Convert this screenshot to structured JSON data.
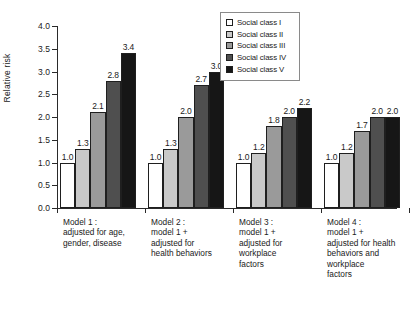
{
  "chart_data": {
    "type": "bar",
    "title": "",
    "xlabel": "",
    "ylabel": "Relative risk",
    "ylim": [
      0.0,
      4.0
    ],
    "ytick_labels": [
      "0.0",
      "0.5",
      "1.0",
      "1.5",
      "2.0",
      "2.5",
      "3.0",
      "3.5",
      "4.0"
    ],
    "ytick_values": [
      0.0,
      0.5,
      1.0,
      1.5,
      2.0,
      2.5,
      3.0,
      3.5,
      4.0
    ],
    "grid": false,
    "legend_position": "top-center-right",
    "categories": [
      "Model 1 :\nadjusted for age,\ngender, disease",
      "Model 2 :\nmodel 1 +\nadjusted for\nhealth behaviors",
      "Model 3 :\nmodel 1 +\nadjusted for\nworkplace\nfactors",
      "Model 4 :\nmodel 1 +\nadjusted for health\nbehaviors and\nworkplace\nfactors"
    ],
    "series": [
      {
        "name": "Social class I",
        "color": "#ffffff",
        "values": [
          1.0,
          1.0,
          1.0,
          1.0
        ]
      },
      {
        "name": "Social class II",
        "color": "#c9c9c9",
        "values": [
          1.3,
          1.3,
          1.2,
          1.2
        ]
      },
      {
        "name": "Social class III",
        "color": "#9a9a9a",
        "values": [
          2.1,
          2.0,
          1.8,
          1.7
        ]
      },
      {
        "name": "Social class IV",
        "color": "#4f4f4f",
        "values": [
          2.8,
          2.7,
          2.0,
          2.0
        ]
      },
      {
        "name": "Social class V",
        "color": "#161616",
        "values": [
          3.4,
          3.0,
          2.2,
          2.0
        ]
      }
    ],
    "data_labels": [
      [
        "1.0",
        "1.3",
        "2.1",
        "2.8",
        "3.4"
      ],
      [
        "1.0",
        "1.3",
        "2.0",
        "2.7",
        "3.0"
      ],
      [
        "1.0",
        "1.2",
        "1.8",
        "2.0",
        "2.2"
      ],
      [
        "1.0",
        "1.2",
        "1.7",
        "2.0",
        "2.0"
      ]
    ]
  },
  "legend": {
    "items": [
      {
        "label": "Social class I"
      },
      {
        "label": "Social class II"
      },
      {
        "label": "Social class III"
      },
      {
        "label": "Social class IV"
      },
      {
        "label": "Social class V"
      }
    ]
  }
}
